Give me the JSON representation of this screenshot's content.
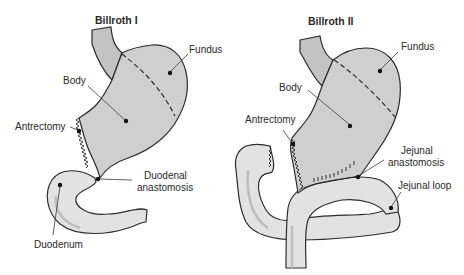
{
  "figure": {
    "panels": [
      {
        "id": "billroth-1",
        "title": "Billroth I",
        "labels": {
          "fundus": "Fundus",
          "body": "Body",
          "antrectomy": "Antrectomy",
          "anastomosis_line1": "Duodenal",
          "anastomosis_line2": "anastomosis",
          "duodenum": "Duodenum"
        }
      },
      {
        "id": "billroth-2",
        "title": "Billroth II",
        "labels": {
          "fundus": "Fundus",
          "body": "Body",
          "antrectomy": "Antrectomy",
          "anastomosis_line1": "Jejunal",
          "anastomosis_line2": "anastomosis",
          "jejunal_loop": "Jejunal loop"
        }
      }
    ],
    "colors": {
      "stomach": "#cfcfcf",
      "bowel": "#e2e2e2",
      "outline": "#2c2c2c",
      "background": "#ffffff"
    }
  }
}
